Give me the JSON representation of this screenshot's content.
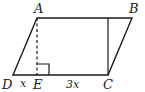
{
  "figure": {
    "shape": "parallelogram",
    "vertices": {
      "A": {
        "label": "A",
        "x": 37,
        "y": 18
      },
      "B": {
        "label": "B",
        "x": 132,
        "y": 18
      },
      "C": {
        "label": "C",
        "x": 108,
        "y": 75
      },
      "D": {
        "label": "D",
        "x": 13,
        "y": 75
      },
      "E": {
        "label": "E",
        "x": 37,
        "y": 75
      }
    },
    "segments": {
      "DE": {
        "label": "x"
      },
      "EC": {
        "label": "3x"
      }
    },
    "altitude_AE": {
      "style": "dashed"
    },
    "altitude_C": {
      "style": "solid"
    },
    "right_angle_marker": "at E",
    "stroke_color": "#1a1a1a"
  }
}
